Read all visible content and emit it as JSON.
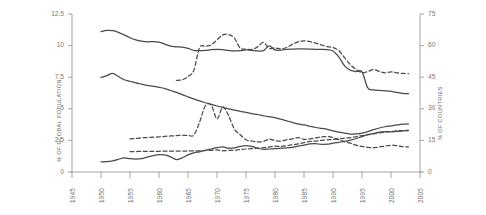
{
  "chart_data": {
    "type": "line",
    "title": "",
    "subtitle": "",
    "xlabel": "",
    "ylabel": "% OF GLOBAL POPULATION",
    "y2label": "% OF COUNTRIES",
    "grid": false,
    "legend": "none",
    "xlim": [
      1945,
      2005
    ],
    "ylim": [
      0,
      12.5
    ],
    "y2lim": [
      0,
      75
    ],
    "x_ticks": [
      "1945",
      "1950",
      "1955",
      "1960",
      "1965",
      "1970",
      "1975",
      "1980",
      "1985",
      "1990",
      "1995",
      "2000",
      "2005"
    ],
    "y_ticks": [
      "0",
      "2.5",
      "5",
      "7.5",
      "10",
      "12.5"
    ],
    "y2_ticks": [
      "0",
      "15",
      "30",
      "45",
      "60",
      "75"
    ],
    "line_color": "#4a4a4a",
    "axis_color": "#9a9a9a",
    "series": [
      {
        "name": "upper-solid",
        "style": "solid",
        "axis": "left",
        "x": [
          1950,
          1951,
          1952,
          1953,
          1954,
          1955,
          1956,
          1957,
          1958,
          1959,
          1960,
          1961,
          1962,
          1963,
          1964,
          1965,
          1966,
          1967,
          1968,
          1969,
          1970,
          1971,
          1972,
          1973,
          1974,
          1975,
          1976,
          1977,
          1978,
          1979,
          1980,
          1981,
          1982,
          1983,
          1984,
          1985,
          1986,
          1987,
          1988,
          1989,
          1990,
          1991,
          1992,
          1993,
          1994,
          1995,
          1996,
          1997,
          1998,
          1999,
          2000,
          2001,
          2002,
          2003
        ],
        "values": [
          11.1,
          11.2,
          11.18,
          11.05,
          10.85,
          10.62,
          10.45,
          10.35,
          10.3,
          10.32,
          10.28,
          10.12,
          9.95,
          9.9,
          9.88,
          9.78,
          9.62,
          9.6,
          9.62,
          9.68,
          9.7,
          9.68,
          9.62,
          9.58,
          9.6,
          9.66,
          9.62,
          9.58,
          9.6,
          9.98,
          9.66,
          9.64,
          9.7,
          9.72,
          9.74,
          9.74,
          9.72,
          9.7,
          9.7,
          9.68,
          9.58,
          9.1,
          8.4,
          8.05,
          7.95,
          7.92,
          6.65,
          6.5,
          6.45,
          6.42,
          6.38,
          6.3,
          6.22,
          6.2
        ]
      },
      {
        "name": "upper-dashed",
        "style": "dashed",
        "axis": "left",
        "x": [
          1963,
          1964,
          1965,
          1966,
          1967,
          1968,
          1969,
          1970,
          1971,
          1972,
          1973,
          1974,
          1975,
          1976,
          1977,
          1978,
          1979,
          1980,
          1981,
          1982,
          1983,
          1984,
          1985,
          1986,
          1987,
          1988,
          1989,
          1990,
          1991,
          1992,
          1993,
          1994,
          1995,
          1996,
          1997,
          1998,
          1999,
          2000,
          2001,
          2002,
          2003
        ],
        "values": [
          7.25,
          7.3,
          7.55,
          8.05,
          9.85,
          9.95,
          10.05,
          10.45,
          10.85,
          10.88,
          10.6,
          9.8,
          9.72,
          9.7,
          9.9,
          10.25,
          9.78,
          9.82,
          9.74,
          9.85,
          10.1,
          10.3,
          10.38,
          10.32,
          10.2,
          10.05,
          9.92,
          9.85,
          9.6,
          9.05,
          8.5,
          8.1,
          7.85,
          7.95,
          8.1,
          7.95,
          7.85,
          7.92,
          7.85,
          7.8,
          7.78
        ]
      },
      {
        "name": "middle-solid",
        "style": "solid",
        "axis": "left",
        "x": [
          1950,
          1951,
          1952,
          1953,
          1954,
          1955,
          1956,
          1957,
          1958,
          1959,
          1960,
          1961,
          1962,
          1963,
          1964,
          1965,
          1966,
          1967,
          1968,
          1969,
          1970,
          1971,
          1972,
          1973,
          1974,
          1975,
          1976,
          1977,
          1978,
          1979,
          1980,
          1981,
          1982,
          1983,
          1984,
          1985,
          1986,
          1987,
          1988,
          1989,
          1990,
          1991,
          1992,
          1993,
          1994,
          1995,
          1996,
          1997,
          1998,
          1999,
          2000,
          2001,
          2002,
          2003
        ],
        "values": [
          7.48,
          7.62,
          7.8,
          7.55,
          7.3,
          7.18,
          7.05,
          6.95,
          6.85,
          6.78,
          6.7,
          6.6,
          6.45,
          6.3,
          6.12,
          5.95,
          5.78,
          5.62,
          5.48,
          5.35,
          5.22,
          5.1,
          5.0,
          4.9,
          4.8,
          4.72,
          4.62,
          4.55,
          4.45,
          4.38,
          4.3,
          4.18,
          4.05,
          3.92,
          3.8,
          3.72,
          3.62,
          3.52,
          3.45,
          3.38,
          3.25,
          3.15,
          3.08,
          3.0,
          3.02,
          3.08,
          3.2,
          3.35,
          3.48,
          3.58,
          3.65,
          3.72,
          3.78,
          3.8
        ]
      },
      {
        "name": "lower-dashed-high",
        "style": "dashed",
        "axis": "left",
        "x": [
          1955,
          1956,
          1957,
          1958,
          1959,
          1960,
          1961,
          1962,
          1963,
          1964,
          1965,
          1966,
          1967,
          1968,
          1969,
          1970,
          1971,
          1972,
          1973,
          1974,
          1975,
          1976,
          1977,
          1978,
          1979,
          1980,
          1981,
          1982,
          1983,
          1984,
          1985,
          1986,
          1987,
          1988,
          1989,
          1990,
          1991,
          1992,
          1993,
          1994,
          1995,
          1996,
          1997,
          1998,
          1999,
          2000,
          2001,
          2002,
          2003
        ],
        "values": [
          2.62,
          2.65,
          2.7,
          2.72,
          2.75,
          2.78,
          2.82,
          2.85,
          2.88,
          2.9,
          2.9,
          2.92,
          3.95,
          5.25,
          5.3,
          4.2,
          5.15,
          4.45,
          3.4,
          2.95,
          2.55,
          2.45,
          2.38,
          2.42,
          2.6,
          2.48,
          2.45,
          2.55,
          2.62,
          2.72,
          2.58,
          2.62,
          2.7,
          2.78,
          2.8,
          2.72,
          2.55,
          2.4,
          2.28,
          2.12,
          2.02,
          1.95,
          1.92,
          1.98,
          2.05,
          2.12,
          2.08,
          2.0,
          1.98
        ]
      },
      {
        "name": "lower-dashed-low",
        "style": "dashed",
        "axis": "left",
        "x": [
          1955,
          1956,
          1957,
          1958,
          1959,
          1960,
          1961,
          1962,
          1963,
          1964,
          1965,
          1966,
          1967,
          1968,
          1969,
          1970,
          1971,
          1972,
          1973,
          1974,
          1975,
          1976,
          1977,
          1978,
          1979,
          1980,
          1981,
          1982,
          1983,
          1984,
          1985,
          1986,
          1987,
          1988,
          1989,
          1990,
          1991,
          1992,
          1993,
          1994,
          1995,
          1996,
          1997,
          1998,
          1999,
          2000,
          2001,
          2002,
          2003
        ],
        "values": [
          1.62,
          1.62,
          1.63,
          1.63,
          1.64,
          1.64,
          1.65,
          1.65,
          1.66,
          1.66,
          1.66,
          1.67,
          1.68,
          1.7,
          1.72,
          1.75,
          1.68,
          1.7,
          1.72,
          1.78,
          1.82,
          1.85,
          1.88,
          1.92,
          1.98,
          2.05,
          2.02,
          2.08,
          2.15,
          2.22,
          2.32,
          2.42,
          2.45,
          2.5,
          2.55,
          2.58,
          2.62,
          2.68,
          2.72,
          2.8,
          2.88,
          2.95,
          3.02,
          3.1,
          3.15,
          3.2,
          3.25,
          3.28,
          3.3
        ]
      },
      {
        "name": "bottom-solid",
        "style": "solid",
        "axis": "left",
        "x": [
          1950,
          1951,
          1952,
          1953,
          1954,
          1955,
          1956,
          1957,
          1958,
          1959,
          1960,
          1961,
          1962,
          1963,
          1964,
          1965,
          1966,
          1967,
          1968,
          1969,
          1970,
          1971,
          1972,
          1973,
          1974,
          1975,
          1976,
          1977,
          1978,
          1979,
          1980,
          1981,
          1982,
          1983,
          1984,
          1985,
          1986,
          1987,
          1988,
          1989,
          1990,
          1991,
          1992,
          1993,
          1994,
          1995,
          1996,
          1997,
          1998,
          1999,
          2000,
          2001,
          2002,
          2003
        ],
        "values": [
          0.8,
          0.82,
          0.88,
          1.0,
          1.12,
          1.05,
          1.02,
          1.05,
          1.18,
          1.3,
          1.38,
          1.35,
          1.2,
          0.98,
          1.12,
          1.35,
          1.52,
          1.6,
          1.72,
          1.82,
          1.92,
          1.98,
          1.88,
          1.9,
          2.02,
          2.08,
          2.02,
          1.88,
          1.8,
          1.82,
          1.85,
          1.88,
          1.9,
          1.95,
          2.05,
          2.12,
          2.22,
          2.25,
          2.18,
          2.2,
          2.28,
          2.35,
          2.42,
          2.52,
          2.65,
          2.8,
          2.95,
          3.05,
          3.15,
          3.2,
          3.18,
          3.22,
          3.25,
          3.28
        ]
      }
    ]
  },
  "axes": {
    "left": {
      "label": "% OF GLOBAL POPULATION",
      "ticks": [
        "12.5",
        "10",
        "7.5",
        "5",
        "2.5",
        "0"
      ]
    },
    "right": {
      "label": "% OF COUNTRIES",
      "ticks": [
        "75",
        "60",
        "45",
        "30",
        "15",
        "0"
      ]
    },
    "bottom": {
      "ticks": [
        "1945",
        "1950",
        "1955",
        "1960",
        "1965",
        "1970",
        "1975",
        "1980",
        "1985",
        "1990",
        "1995",
        "2000",
        "2005"
      ]
    }
  }
}
